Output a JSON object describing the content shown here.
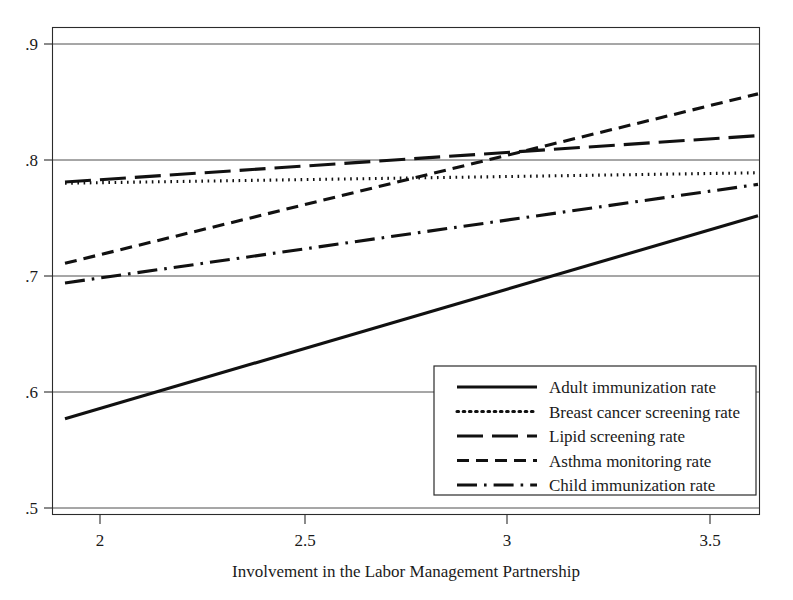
{
  "chart_data": {
    "type": "line",
    "title": "",
    "xlabel": "Involvement in the Labor Management Partnership",
    "ylabel": "",
    "xlim": [
      1.86,
      3.63
    ],
    "ylim": [
      0.5,
      0.9
    ],
    "xticks": [
      2,
      2.5,
      3,
      3.5
    ],
    "xtick_labels": [
      "2",
      "2.5",
      "3",
      "3.5"
    ],
    "yticks": [
      0.5,
      0.6,
      0.7,
      0.8,
      0.9
    ],
    "ytick_labels": [
      ".5",
      ".6",
      ".7",
      ".8",
      ".9"
    ],
    "grid": "horizontal",
    "legend_position": "lower-right",
    "x": [
      1.9,
      3.61
    ],
    "series": [
      {
        "name": "Adult immunization rate",
        "dash": "solid",
        "values": [
          0.577,
          0.752
        ],
        "color": "#111111"
      },
      {
        "name": "Breast cancer screening rate",
        "dash": "dotted",
        "values": [
          0.78,
          0.789
        ],
        "color": "#111111"
      },
      {
        "name": "Lipid screening rate",
        "dash": "long-dash",
        "values": [
          0.781,
          0.821
        ],
        "color": "#111111"
      },
      {
        "name": "Asthma monitoring rate",
        "dash": "short-dash",
        "values": [
          0.711,
          0.857
        ],
        "color": "#111111"
      },
      {
        "name": "Child immunization rate",
        "dash": "dash-dot",
        "values": [
          0.694,
          0.779
        ],
        "color": "#111111"
      }
    ]
  },
  "legend": {
    "entries": [
      "Adult immunization rate",
      "Breast cancer screening rate",
      "Lipid screening rate",
      "Asthma monitoring rate",
      "Child immunization rate"
    ]
  },
  "axis": {
    "x_title": "Involvement in the Labor Management Partnership",
    "x_tick_labels": [
      "2",
      "2.5",
      "3",
      "3.5"
    ],
    "y_tick_labels": [
      ".9",
      ".8",
      ".7",
      ".6",
      ".5"
    ]
  }
}
